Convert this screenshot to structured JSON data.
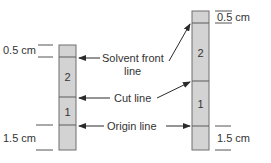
{
  "diagram": {
    "left_strip": {
      "top_margin_label": "0.5 cm",
      "bottom_margin_label": "1.5 cm",
      "region_upper": "2",
      "region_lower": "1"
    },
    "right_strip": {
      "top_margin_label": "0.5 cm",
      "bottom_margin_label": "1.5 cm",
      "region_upper": "2",
      "region_lower": "1"
    },
    "callouts": {
      "solvent_front_line1": "Solvent front",
      "solvent_front_line2": "line",
      "cut_line": "Cut line",
      "origin_line": "Origin line"
    },
    "colors": {
      "strip_fill": "#d3d3d3",
      "strip_border": "#6e6e6e",
      "text": "#333333"
    }
  }
}
